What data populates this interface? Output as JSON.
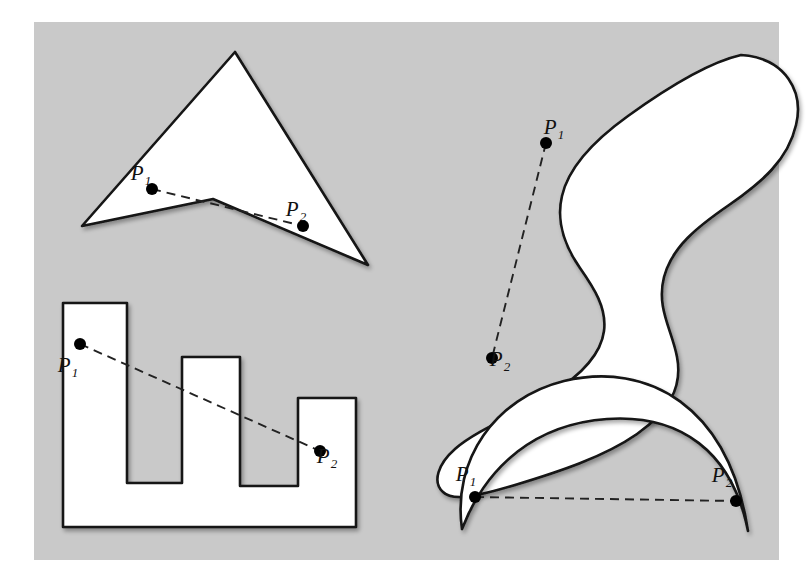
{
  "figure": {
    "background_color": "#ffffff",
    "panel_color": "#c9c9c9",
    "panel_rect": {
      "x": 34,
      "y": 22,
      "width": 745,
      "height": 538
    },
    "shape_fill": "#ffffff",
    "shape_stroke": "#141414",
    "dash_stroke": "#222222",
    "dot_color": "#000000",
    "dot_radius": 6,
    "stroke_width": 2.6,
    "dash_pattern": "9 6",
    "point_labels": {
      "p1": "P",
      "p1_sub": "1",
      "p2": "P",
      "p2_sub": "2"
    },
    "shapes": [
      {
        "name": "dart-triangle",
        "kind": "polygon",
        "description": "Concave arrowhead (dart) quadrilateral",
        "points": "235,52 368,265 213,199 82,226",
        "p1": {
          "x": 152,
          "y": 189,
          "label_x": 141,
          "label_y": 180
        },
        "p2": {
          "x": 303,
          "y": 226,
          "label_x": 296,
          "label_y": 216
        }
      },
      {
        "name": "comb-polygon",
        "kind": "polygon",
        "description": "Castle / comb shaped rectilinear polygon with three teeth",
        "points": "63,303 127,303 127,483 182,483 182,357 240,357 240,486 298,486 298,398 356,398 356,527 63,527",
        "p1": {
          "x": 80,
          "y": 344,
          "label_x": 68,
          "label_y": 372
        },
        "p2": {
          "x": 320,
          "y": 451,
          "label_x": 327,
          "label_y": 463
        }
      },
      {
        "name": "s-blob",
        "kind": "path",
        "description": "Smooth S-shaped (kidney) blob",
        "d": "M 741,55 C 786,58 804,92 796,125 C 788,160 762,182 729,205 C 697,227 672,247 664,277 C 656,308 672,330 677,357 C 683,388 668,412 637,434 C 604,457 558,472 515,485 C 478,496 453,502 443,492 C 432,482 438,464 455,449 C 478,429 519,414 551,394 C 583,374 601,354 604,331 C 607,308 594,288 580,268 C 564,245 556,221 562,196 C 569,165 596,139 628,116 C 664,90 706,63 741,55 Z",
        "p1": {
          "x": 546,
          "y": 143,
          "label_x": 554,
          "label_y": 134
        },
        "p2": {
          "x": 492,
          "y": 358,
          "label_x": 500,
          "label_y": 366
        }
      },
      {
        "name": "crescent",
        "kind": "path",
        "description": "Crescent (lune) opening downward",
        "d": "M 462,529 C 452,460 495,398 564,381 C 648,361 729,406 748,531 C 732,451 680,414 607,419 C 537,424 487,464 462,529 Z",
        "p1": {
          "x": 475,
          "y": 497,
          "label_x": 466,
          "label_y": 481
        },
        "p2": {
          "x": 736,
          "y": 501,
          "label_x": 722,
          "label_y": 482
        }
      }
    ]
  }
}
